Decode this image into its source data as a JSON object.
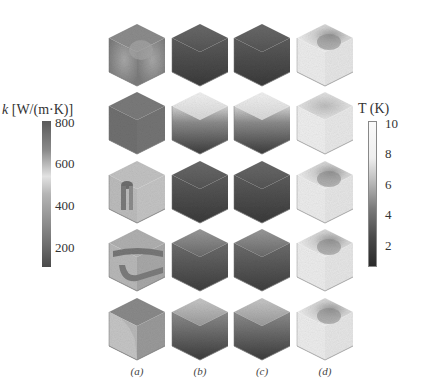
{
  "figure": {
    "left_colorbar": {
      "label_symbol": "k",
      "label_unit": " [W/(m·K)]",
      "ticks": [
        "800",
        "600",
        "400",
        "200"
      ],
      "tick_values": [
        800,
        600,
        400,
        200
      ],
      "range": [
        100,
        800
      ]
    },
    "right_colorbar": {
      "label": "T (K)",
      "ticks": [
        "10",
        "8",
        "6",
        "4",
        "2"
      ],
      "tick_values": [
        10,
        8,
        6,
        4,
        2
      ],
      "range": [
        0,
        10
      ]
    },
    "columns": [
      "(a)",
      "(b)",
      "(c)",
      "(d)"
    ],
    "rows": 5
  }
}
